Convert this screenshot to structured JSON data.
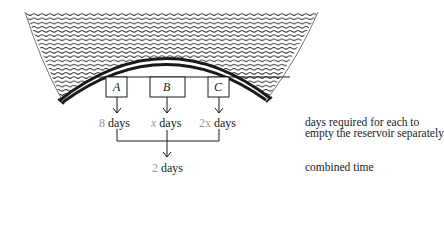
{
  "figure": {
    "type": "reservoir-outlet-diagram",
    "outlets": [
      {
        "id": "A",
        "time_value": "8",
        "time_unit": "days"
      },
      {
        "id": "B",
        "time_value": "x",
        "time_unit": "days"
      },
      {
        "id": "C",
        "time_value": "2x",
        "time_unit": "days"
      }
    ],
    "combined": {
      "time_value": "2",
      "time_unit": "days"
    },
    "annotations": {
      "separate_line1": "days required for each to",
      "separate_line2": "empty the reservoir separately",
      "combined": "combined time"
    },
    "colors": {
      "ink": "#1a1a1a",
      "value_gray": "#9a9a9a",
      "background": "#ffffff"
    }
  }
}
